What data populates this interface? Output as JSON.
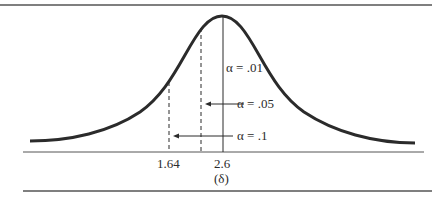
{
  "figure": {
    "type": "normal-distribution-critical-values",
    "colors": {
      "ink": "#2b2b2b",
      "rule": "#555555",
      "background": "#ffffff"
    },
    "axis": {
      "ticks": [
        {
          "label": "1.64",
          "x": 169,
          "style": "dashed"
        },
        {
          "label": "",
          "x": 201,
          "style": "dashed"
        },
        {
          "label": "2.6",
          "x": 223,
          "style": "solid"
        }
      ],
      "delta_label": "(δ)"
    },
    "annotations": [
      {
        "label": "α = .01",
        "target": "solid line at 2.6"
      },
      {
        "label": "α = .05",
        "target": "middle dashed line",
        "arrow": "left"
      },
      {
        "label": "α = .1",
        "target": "dashed line at 1.64",
        "arrow": "left"
      }
    ]
  },
  "labels": {
    "tick_164": "1.64",
    "tick_26": "2.6",
    "delta": "(δ)",
    "alpha_01": "α = .01",
    "alpha_05": "α = .05",
    "alpha_1": "α = .1"
  }
}
